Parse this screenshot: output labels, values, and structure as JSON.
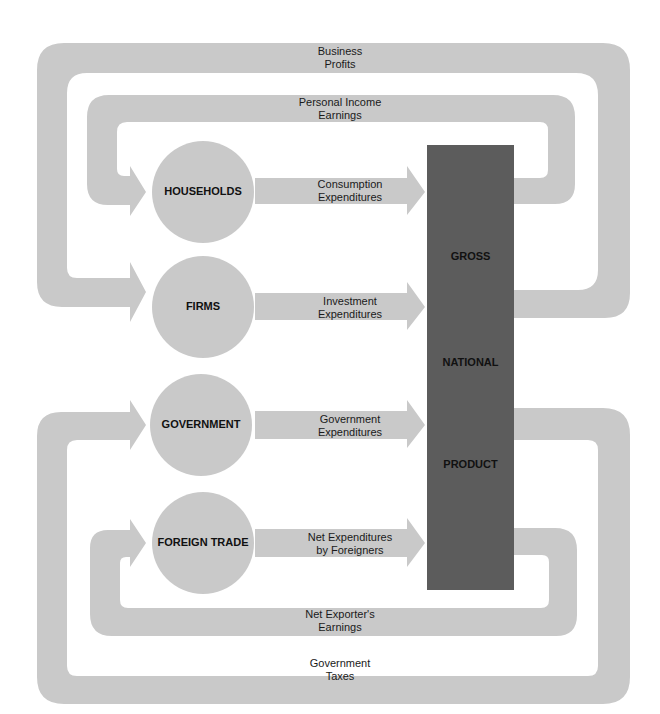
{
  "colors": {
    "flow": "#c9c9c9",
    "gnp_bar": "#5c5c5c",
    "text": "#1a1a1a",
    "background": "#ffffff"
  },
  "sectors": [
    {
      "label": "HOUSEHOLDS"
    },
    {
      "label": "FIRMS"
    },
    {
      "label": "GOVERNMENT"
    },
    {
      "label": "FOREIGN TRADE"
    }
  ],
  "gnp": {
    "words": [
      "GROSS",
      "NATIONAL",
      "PRODUCT"
    ]
  },
  "flows_in": [
    {
      "line1": "Consumption",
      "line2": "Expenditures"
    },
    {
      "line1": "Investment",
      "line2": "Expenditures"
    },
    {
      "line1": "Government",
      "line2": "Expenditures"
    },
    {
      "line1": "Net Expenditures",
      "line2": "by Foreigners"
    }
  ],
  "flows_out": {
    "business_profits": {
      "line1": "Business",
      "line2": "Profits"
    },
    "personal_income": {
      "line1": "Personal Income",
      "line2": "Earnings"
    },
    "net_exporters": {
      "line1": "Net Exporter's",
      "line2": "Earnings"
    },
    "government_taxes": {
      "line1": "Government",
      "line2": "Taxes"
    }
  }
}
